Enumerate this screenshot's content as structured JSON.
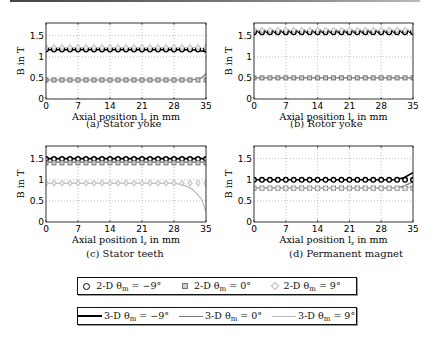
{
  "captions": {
    "a": "(a) Stator yoke",
    "b": "(b) Rotor yoke",
    "c": "(c) Stator teeth",
    "d": "(d) Permanent magnet"
  },
  "axes": {
    "xlabel": "Axial position l",
    "xlabel_sub": "z",
    "xlabel_suffix": " in mm",
    "ylabel": "B in T",
    "xticks": [
      "0",
      "7",
      "14",
      "21",
      "28",
      "35"
    ],
    "yticks": [
      "0",
      "0.5",
      "1",
      "1.5"
    ]
  },
  "legend": {
    "row1": [
      {
        "symbol": "circle",
        "label_pre": "2-D θ",
        "label_sub": "m",
        "label_post": " = −9°",
        "color": "#000000"
      },
      {
        "symbol": "square",
        "label_pre": "2-D θ",
        "label_sub": "m",
        "label_post": " = 0°",
        "color": "#777777"
      },
      {
        "symbol": "diamond",
        "label_pre": "2-D θ",
        "label_sub": "m",
        "label_post": " = 9°",
        "color": "#bbbbbb"
      }
    ],
    "row2": [
      {
        "symbol": "line",
        "label_pre": "3-D θ",
        "label_sub": "m",
        "label_post": " = −9°",
        "color": "#000000"
      },
      {
        "symbol": "line",
        "label_pre": "3-D θ",
        "label_sub": "m",
        "label_post": " = 0°",
        "color": "#777777"
      },
      {
        "symbol": "line",
        "label_pre": "3-D θ",
        "label_sub": "m",
        "label_post": " = 9°",
        "color": "#bbbbbb"
      }
    ]
  },
  "chart_data": [
    {
      "type": "line",
      "title": "(a) Stator yoke",
      "xlabel": "Axial position l_z in mm",
      "ylabel": "B in T",
      "xlim": [
        0,
        35
      ],
      "ylim": [
        0,
        1.8
      ],
      "grid": true,
      "series": [
        {
          "name": "2-D θm = −9°",
          "marker": "circle",
          "y_const": 1.17
        },
        {
          "name": "2-D θm = 0°",
          "marker": "square",
          "y_const": 0.45
        },
        {
          "name": "2-D θm = 9°",
          "marker": "diamond",
          "y_const": 1.22
        },
        {
          "name": "3-D θm = −9°",
          "x": [
            0,
            30,
            33,
            35
          ],
          "y": [
            1.17,
            1.17,
            1.16,
            1.12
          ]
        },
        {
          "name": "3-D θm = 0°",
          "x": [
            0,
            32,
            34,
            35
          ],
          "y": [
            0.45,
            0.45,
            0.5,
            0.6
          ]
        },
        {
          "name": "3-D θm = 9°",
          "x": [
            0,
            33,
            35
          ],
          "y": [
            1.22,
            1.22,
            1.18
          ]
        }
      ]
    },
    {
      "type": "line",
      "title": "(b) Rotor yoke",
      "xlabel": "Axial position l_z in mm",
      "ylabel": "B in T",
      "xlim": [
        0,
        35
      ],
      "ylim": [
        0,
        1.8
      ],
      "grid": true,
      "series": [
        {
          "name": "2-D θm = −9°",
          "marker": "circle",
          "y_const": 1.58
        },
        {
          "name": "2-D θm = 0°",
          "marker": "square",
          "y_const": 0.5
        },
        {
          "name": "2-D θm = 9°",
          "marker": "diamond",
          "y_const": 1.63
        },
        {
          "name": "3-D θm = −9°",
          "y_const": 1.6,
          "ripple": 0.03
        },
        {
          "name": "3-D θm = 0°",
          "y_const": 0.5
        },
        {
          "name": "3-D θm = 9°",
          "y_const": 1.62,
          "ripple": 0.03
        }
      ]
    },
    {
      "type": "line",
      "title": "(c) Stator teeth",
      "xlabel": "Axial position l_z in mm",
      "ylabel": "B in T",
      "xlim": [
        0,
        35
      ],
      "ylim": [
        0,
        1.8
      ],
      "grid": true,
      "series": [
        {
          "name": "2-D θm = −9°",
          "marker": "circle",
          "y_const": 1.49
        },
        {
          "name": "2-D θm = 0°",
          "marker": "square",
          "y_const": 1.4
        },
        {
          "name": "2-D θm = 9°",
          "marker": "diamond",
          "y_const": 0.92
        },
        {
          "name": "3-D θm = −9°",
          "y_const": 1.5
        },
        {
          "name": "3-D θm = 0°",
          "y_const": 1.42
        },
        {
          "name": "3-D θm = 9°",
          "x": [
            0,
            28,
            30,
            32,
            34,
            35
          ],
          "y": [
            0.92,
            0.92,
            0.88,
            0.78,
            0.55,
            0.25
          ]
        }
      ]
    },
    {
      "type": "line",
      "title": "(d) Permanent magnet",
      "xlabel": "Axial position l_z in mm",
      "ylabel": "B in T",
      "xlim": [
        0,
        35
      ],
      "ylim": [
        0,
        1.8
      ],
      "grid": true,
      "series": [
        {
          "name": "2-D θm = −9°",
          "marker": "circle",
          "y_const": 1.0
        },
        {
          "name": "2-D θm = 0°",
          "marker": "square",
          "y_const": 0.8
        },
        {
          "name": "2-D θm = 9°",
          "marker": "diamond",
          "y_const": 0.8
        },
        {
          "name": "3-D θm = −9°",
          "x": [
            0,
            31,
            33,
            35
          ],
          "y": [
            1.0,
            1.0,
            1.05,
            1.17
          ]
        },
        {
          "name": "3-D θm = 0°",
          "x": [
            0,
            31,
            33,
            35
          ],
          "y": [
            0.8,
            0.8,
            0.85,
            0.95
          ]
        },
        {
          "name": "3-D θm = 9°",
          "x": [
            0,
            31,
            35
          ],
          "y": [
            0.8,
            0.8,
            0.83
          ]
        }
      ]
    }
  ]
}
